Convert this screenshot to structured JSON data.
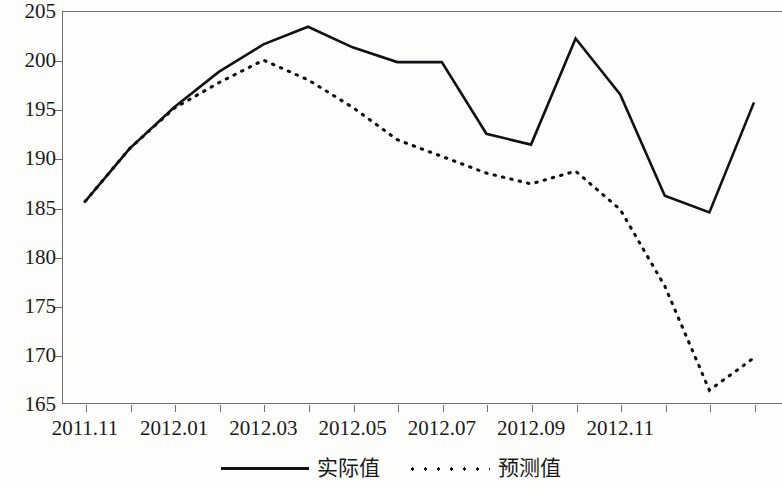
{
  "chart_data": {
    "type": "line",
    "title": "",
    "subtitle": "",
    "xlabel": "",
    "ylabel": "",
    "ylim": [
      165,
      205
    ],
    "ytick_values": [
      165,
      170,
      175,
      180,
      185,
      190,
      195,
      200,
      205
    ],
    "ytick_labels": [
      "165",
      "170",
      "175",
      "180",
      "185",
      "190",
      "195",
      "200",
      "205"
    ],
    "xtick_labels": [
      "2011.11",
      "2012.01",
      "2012.03",
      "2012.05",
      "2012.07",
      "2012.09",
      "2012.11"
    ],
    "x_label_index": [
      0,
      2,
      4,
      6,
      8,
      10,
      12
    ],
    "x_periods": [
      "2011.11",
      "2011.12",
      "2012.01",
      "2012.02",
      "2012.03",
      "2012.04",
      "2012.05",
      "2012.06",
      "2012.07",
      "2012.08",
      "2012.09",
      "2012.10",
      "2012.11",
      "2012.12",
      "2013.01",
      "2013.02"
    ],
    "grid": false,
    "legend_position": "bottom-center",
    "series": [
      {
        "name": "实际值",
        "style": "solid",
        "color": "#111111",
        "values": [
          185.6,
          191.0,
          195.2,
          198.8,
          201.6,
          203.4,
          201.3,
          199.8,
          199.8,
          192.5,
          191.4,
          202.2,
          196.5,
          186.2,
          184.5,
          195.7
        ]
      },
      {
        "name": "预测值",
        "style": "dotted",
        "color": "#111111",
        "values": [
          185.6,
          191.0,
          195.1,
          197.7,
          200.0,
          198.0,
          195.2,
          191.9,
          190.2,
          188.5,
          187.4,
          188.7,
          184.8,
          177.0,
          166.4,
          169.7
        ]
      }
    ]
  },
  "legend": {
    "items": [
      {
        "label": "实际值",
        "style": "solid"
      },
      {
        "label": "预测值",
        "style": "dotted"
      }
    ]
  }
}
